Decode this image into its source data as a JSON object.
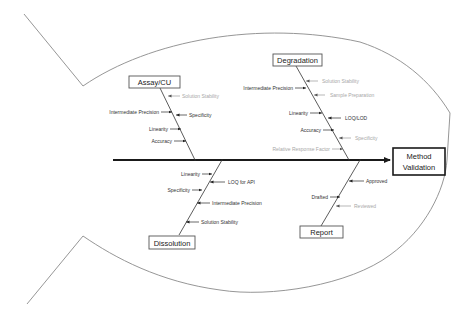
{
  "diagram": {
    "type": "fishbone",
    "effect": {
      "line1": "Method",
      "line2": "Validation"
    },
    "categories": {
      "assay": {
        "label": "Assay/CU",
        "causes": [
          {
            "label": "Solution Stability",
            "side": "right",
            "faded": true
          },
          {
            "label": "Intermediate Precision",
            "side": "left",
            "faded": false
          },
          {
            "label": "Specificity",
            "side": "right",
            "faded": false
          },
          {
            "label": "Linearity",
            "side": "left",
            "faded": false
          },
          {
            "label": "Accuracy",
            "side": "left",
            "faded": false
          }
        ]
      },
      "degradation": {
        "label": "Degradation",
        "causes": [
          {
            "label": "Solution Stability",
            "side": "right",
            "faded": true
          },
          {
            "label": "Intermediate Precision",
            "side": "left",
            "faded": false
          },
          {
            "label": "Sample Preparation",
            "side": "right",
            "faded": true
          },
          {
            "label": "Linearity",
            "side": "left",
            "faded": false
          },
          {
            "label": "LOQ/LOD",
            "side": "right",
            "faded": false
          },
          {
            "label": "Accuracy",
            "side": "left",
            "faded": false
          },
          {
            "label": "Specificity",
            "side": "right",
            "faded": true
          },
          {
            "label": "Relative Response Factor",
            "side": "left",
            "faded": true
          }
        ]
      },
      "dissolution": {
        "label": "Dissolution",
        "causes": [
          {
            "label": "Linearity",
            "side": "left",
            "faded": false
          },
          {
            "label": "LOQ for API",
            "side": "right",
            "faded": false
          },
          {
            "label": "Specificity",
            "side": "left",
            "faded": false
          },
          {
            "label": "Intermediate Precision",
            "side": "right",
            "faded": false
          },
          {
            "label": "Solution Stability",
            "side": "right",
            "faded": false
          }
        ]
      },
      "report": {
        "label": "Report",
        "causes": [
          {
            "label": "Approved",
            "side": "right",
            "faded": false
          },
          {
            "label": "Drafted",
            "side": "left",
            "faded": false
          },
          {
            "label": "Reviewed",
            "side": "right",
            "faded": true
          }
        ]
      }
    },
    "colors": {
      "outline": "#8a8a8a",
      "spine": "#1a1a1a",
      "text": "#333333",
      "faded_text": "#a8a8a8"
    }
  }
}
